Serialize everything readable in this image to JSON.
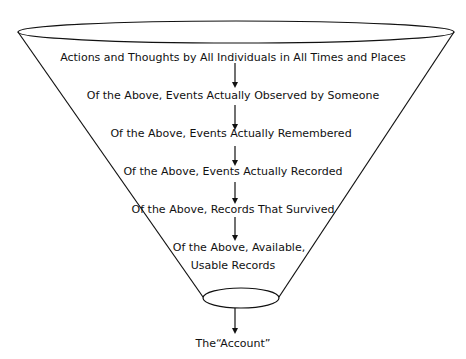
{
  "diagram": {
    "type": "funnel",
    "stages": [
      {
        "label": "Actions and Thoughts by All Individuals in All Times and Places"
      },
      {
        "label": "Of the Above, Events Actually Observed by Someone"
      },
      {
        "label": "Of the Above, Events Actually Remembered"
      },
      {
        "label": "Of the Above, Events Actually Recorded"
      },
      {
        "label": "Of the Above, Records That Survived"
      },
      {
        "label_line1": "Of the Above, Available,",
        "label_line2": "Usable Records"
      }
    ],
    "output": {
      "label": "The“Account”"
    },
    "colors": {
      "stroke": "#111111",
      "background": "#ffffff"
    }
  }
}
